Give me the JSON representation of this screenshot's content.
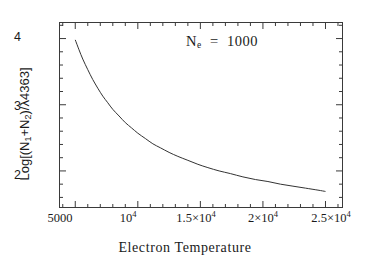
{
  "chart_data": {
    "type": "line",
    "title": "",
    "xlabel": "Electron Temperature",
    "ylabel": "Log[(N₁+N₂)/λ4363]",
    "xlim": [
      3700,
      26400
    ],
    "ylim": [
      1.44,
      4.25
    ],
    "grid": false,
    "legend": null,
    "annotations": [
      {
        "text": "N_e  =  1000",
        "symbol": "N",
        "subscript": "e",
        "equals": "=",
        "value": "1000",
        "x": 15500,
        "y": 3.85
      }
    ],
    "xticks": [
      5000,
      10000,
      15000,
      20000,
      25000
    ],
    "xticklabels": [
      "5000",
      "10⁴",
      "1.5×10⁴",
      "2×10⁴",
      "2.5×10⁴"
    ],
    "xticklabels_parts": [
      {
        "base": "5000",
        "exp": ""
      },
      {
        "base": "10",
        "exp": "4"
      },
      {
        "base": "1.5×10",
        "exp": "4"
      },
      {
        "base": "2×10",
        "exp": "4"
      },
      {
        "base": "2.5×10",
        "exp": "4"
      }
    ],
    "yticks": [
      2,
      3,
      4
    ],
    "yticklabels": [
      "2",
      "3",
      "4"
    ],
    "minor_ticks_x_per_interval": 5,
    "minor_ticks_y_per_interval": 5,
    "tick_direction": "in",
    "series": [
      {
        "name": "Log[(N1+N2)/4363] vs Te",
        "x": [
          5000,
          5300,
          5600,
          6000,
          6400,
          6800,
          7200,
          7600,
          8000,
          8500,
          9000,
          9500,
          10000,
          10600,
          11200,
          11800,
          12500,
          13200,
          14000,
          14800,
          15600,
          16500,
          17400,
          18400,
          19400,
          20400,
          21400,
          22400,
          23400,
          24400,
          25000
        ],
        "y": [
          3.98,
          3.83,
          3.69,
          3.53,
          3.38,
          3.25,
          3.13,
          3.03,
          2.93,
          2.83,
          2.73,
          2.65,
          2.57,
          2.49,
          2.41,
          2.35,
          2.28,
          2.22,
          2.16,
          2.1,
          2.05,
          2.0,
          1.96,
          1.91,
          1.87,
          1.84,
          1.8,
          1.77,
          1.74,
          1.71,
          1.69
        ]
      }
    ],
    "line_color": "#333333",
    "line_width": 1,
    "frame_color": "#3a3a3a",
    "background_color": "#ffffff"
  },
  "axes": {
    "xlabel_text": "Electron Temperature",
    "ylabel_text": "Log[(N",
    "ylabel_sub1": "1",
    "ylabel_mid": "+N",
    "ylabel_sub2": "2",
    "ylabel_tail": ")/λ4363]"
  },
  "annotation": {
    "ne_symbol": "N",
    "ne_sub": "e",
    "ne_rest": "  =  1000"
  }
}
